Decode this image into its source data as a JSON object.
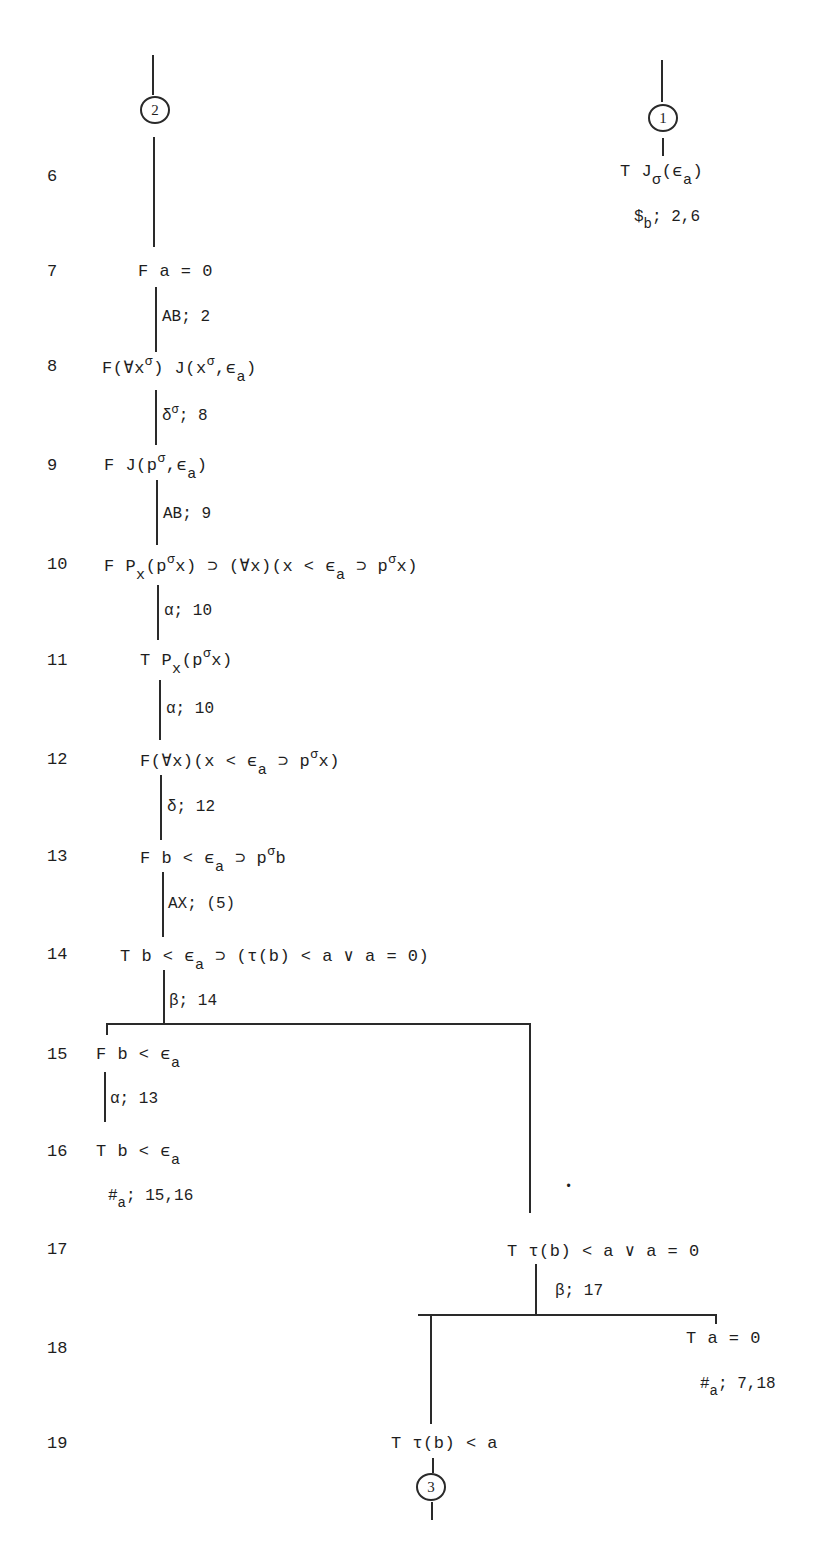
{
  "connectors": {
    "left_top": "2",
    "right_top": "1",
    "bottom": "3"
  },
  "right_branch_top": {
    "formula": {
      "pre": "T J",
      "sub1": "σ",
      "mid": "(ϵ",
      "sub2": "a",
      "post": ")"
    },
    "rule": {
      "pre": "$",
      "sub": "b",
      "post": "; 2,6"
    }
  },
  "lines": [
    {
      "n": "6"
    },
    {
      "n": "7",
      "text": "F a = 0"
    },
    {
      "n": "8",
      "a": "F(∀x",
      "s1": "σ",
      "b": ") J(x",
      "s2": "σ",
      "c": ",ϵ",
      "s3": "a",
      "d": ")"
    },
    {
      "n": "9",
      "a": "F J(p",
      "s1": "σ",
      "b": ",ϵ",
      "s2": "a",
      "c": ")"
    },
    {
      "n": "10",
      "a": "F P",
      "s1": "x",
      "b": "(p",
      "s2": "σ",
      "c": "x) ⊃ (∀x)(x < ϵ",
      "s3": "a",
      "d": " ⊃ p",
      "s4": "σ",
      "e": "x)"
    },
    {
      "n": "11",
      "a": "T P",
      "s1": "x",
      "b": "(p",
      "s2": "σ",
      "c": "x)"
    },
    {
      "n": "12",
      "a": "F(∀x)(x < ϵ",
      "s1": "a",
      "b": " ⊃ p",
      "s2": "σ",
      "c": "x)"
    },
    {
      "n": "13",
      "a": "F b < ϵ",
      "s1": "a",
      "b": " ⊃ p",
      "s2": "σ",
      "c": "b"
    },
    {
      "n": "14",
      "a": "T b < ϵ",
      "s1": "a",
      "b": " ⊃ (τ(b) < a ∨ a = 0)"
    },
    {
      "n": "15",
      "a": "F b < ϵ",
      "s1": "a"
    },
    {
      "n": "16",
      "a": "T b < ϵ",
      "s1": "a"
    },
    {
      "n": "17",
      "text": "T τ(b) < a ∨ a = 0"
    },
    {
      "n": "18",
      "text": "T a = 0"
    },
    {
      "n": "19",
      "text": "T τ(b) < a"
    }
  ],
  "rules": {
    "r7": "AB; 2",
    "r8": {
      "a": "δ",
      "s": "σ",
      "b": "; 8"
    },
    "r9": "AB; 9",
    "r10": "α; 10",
    "r11": "α; 10",
    "r12": "δ; 12",
    "r13": "AX; (5)",
    "r14": "β; 14",
    "r15": "α; 13",
    "r16": {
      "a": "#",
      "s": "a",
      "b": "; 15,16"
    },
    "r17": "β; 17",
    "r18": {
      "a": "#",
      "s": "a",
      "b": "; 7,18"
    }
  }
}
